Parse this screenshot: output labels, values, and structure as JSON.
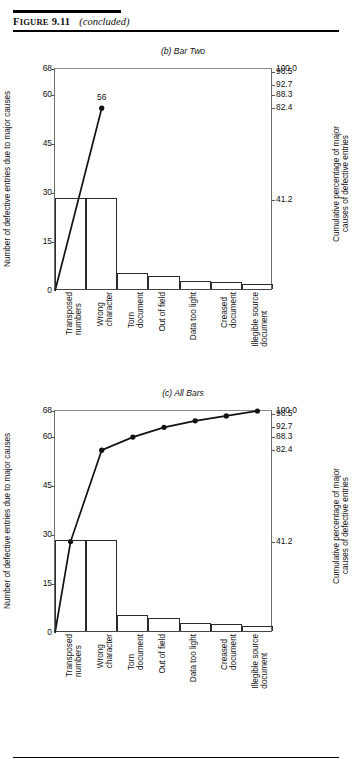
{
  "header": {
    "figure_label_first": "F",
    "figure_label_rest": "IGURE",
    "figure_number": "9.11",
    "status": "(concluded)"
  },
  "axis_titles": {
    "left": "Number of defective entries due to major causes",
    "right": "Cumulative percentage of major\ncauses of defective entries"
  },
  "categories": [
    "Transposed\nnumbers",
    "Wrong\ncharacter",
    "Torn\ndocument",
    "Out of field",
    "Data too light",
    "Creased\ndocument",
    "Illegible source\ndocument"
  ],
  "left_ticks": [
    "68",
    "60",
    "45",
    "30",
    "15",
    "0"
  ],
  "left_tick_values": [
    68,
    60,
    45,
    30,
    15,
    0
  ],
  "right_ticks": [
    "100.0",
    "98.5",
    "92.7",
    "88.3",
    "82.4",
    "41.2"
  ],
  "right_tick_values": [
    68,
    67.0,
    63.0,
    60.0,
    56.0,
    28.0
  ],
  "chart_data": [
    {
      "id": "chart-b",
      "type": "bar",
      "title": "(b) Bar Two",
      "xlabel": "",
      "ylabel": "Number of defective entries due to major causes",
      "y2label": "Cumulative percentage of major causes of defective entries",
      "ylim": [
        0,
        68
      ],
      "y2lim": [
        0,
        100
      ],
      "grid": false,
      "legend": "none",
      "categories": [
        "Transposed numbers",
        "Wrong character",
        "Torn document",
        "Out of field",
        "Data too light",
        "Creased document",
        "Illegible source document"
      ],
      "series": [
        {
          "name": "Number of defective entries",
          "type": "bar",
          "values": [
            28,
            28,
            5,
            4,
            2.5,
            2,
            1.5
          ]
        },
        {
          "name": "Cumulative",
          "type": "line",
          "values": [
            null,
            56,
            null,
            null,
            null,
            null,
            null
          ],
          "points_drawn": [
            {
              "category": "Wrong character",
              "value": 56,
              "label": "56"
            }
          ],
          "line_from": {
            "x_category_edge": "left-axis",
            "value": 0
          }
        }
      ],
      "annotations": [
        {
          "text": "56",
          "value": 56,
          "category": "Wrong character"
        }
      ]
    },
    {
      "id": "chart-c",
      "type": "bar",
      "title": "(c) All Bars",
      "xlabel": "",
      "ylabel": "Number of defective entries due to major causes",
      "y2label": "Cumulative percentage of major causes of defective entries",
      "ylim": [
        0,
        68
      ],
      "y2lim": [
        0,
        100
      ],
      "grid": false,
      "legend": "none",
      "categories": [
        "Transposed numbers",
        "Wrong character",
        "Torn document",
        "Out of field",
        "Data too light",
        "Creased document",
        "Illegible source document"
      ],
      "series": [
        {
          "name": "Number of defective entries",
          "type": "bar",
          "values": [
            28,
            28,
            5,
            4,
            2.5,
            2,
            1.5
          ]
        },
        {
          "name": "Cumulative",
          "type": "line",
          "values": [
            28,
            56,
            60,
            63,
            65,
            66.5,
            68
          ],
          "percent_values": [
            41.2,
            82.4,
            88.3,
            92.7,
            95.6,
            98.5,
            100.0
          ]
        }
      ],
      "annotations": []
    }
  ]
}
